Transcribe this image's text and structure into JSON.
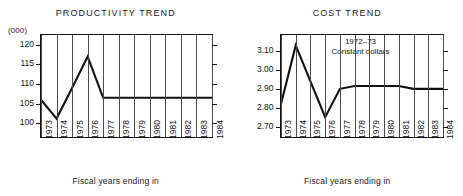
{
  "figure": {
    "panels": [
      {
        "key": "productivity",
        "title": "PRODUCTIVITY TREND",
        "unit_label": "(000)",
        "axis_caption": "Fiscal years ending in",
        "annotation_line1": "",
        "annotation_line2": ""
      },
      {
        "key": "cost",
        "title": "COST TREND",
        "unit_label": "",
        "axis_caption": "Fiscal years ending in",
        "annotation_line1": "1972–73",
        "annotation_line2": "Constant dollars"
      }
    ],
    "ink_color": "#111111",
    "grid_color": "#4a4a4a",
    "background": "#ffffff"
  },
  "chart_data": [
    {
      "type": "line",
      "title": "PRODUCTIVITY TREND",
      "xlabel": "Fiscal years ending in",
      "ylabel": "(000)",
      "categories": [
        "1973",
        "1974",
        "1975",
        "1976",
        "1977",
        "1978",
        "1979",
        "1980",
        "1981",
        "1982",
        "1983",
        "1984"
      ],
      "x": [
        1973,
        1974,
        1975,
        1976,
        1977,
        1978,
        1979,
        1980,
        1981,
        1982,
        1983,
        1984
      ],
      "values": [
        106.0,
        101.2,
        109.0,
        117.0,
        106.5,
        106.5,
        106.5,
        106.5,
        106.5,
        106.5,
        106.5,
        106.5
      ],
      "yticks": [
        100,
        105,
        110,
        115,
        120
      ],
      "ytick_labels": [
        "100",
        "105",
        "110",
        "115",
        "120"
      ],
      "ylim": [
        96.5,
        122.5
      ],
      "xlim": [
        1973,
        1984
      ],
      "grid": true,
      "grid_axis": "x",
      "legend": false,
      "annotations": []
    },
    {
      "type": "line",
      "title": "COST TREND",
      "xlabel": "Fiscal years ending in",
      "ylabel": "",
      "categories": [
        "1973",
        "1974",
        "1975",
        "1976",
        "1977",
        "1978",
        "1979",
        "1980",
        "1981",
        "1982",
        "1983",
        "1984"
      ],
      "x": [
        1973,
        1974,
        1975,
        1976,
        1977,
        1978,
        1979,
        1980,
        1981,
        1982,
        1983,
        1984
      ],
      "values": [
        2.82,
        3.13,
        2.94,
        2.75,
        2.9,
        2.915,
        2.915,
        2.915,
        2.915,
        2.9,
        2.9,
        2.9
      ],
      "yticks": [
        2.7,
        2.8,
        2.9,
        3.0,
        3.1
      ],
      "ytick_labels": [
        "2.70",
        "2.80",
        "2.90",
        "3.00",
        "3.10"
      ],
      "ylim": [
        2.645,
        3.185
      ],
      "xlim": [
        1973,
        1984
      ],
      "grid": true,
      "grid_axis": "x",
      "legend": false,
      "annotations": [
        "1972–73",
        "Constant dollars"
      ]
    }
  ]
}
